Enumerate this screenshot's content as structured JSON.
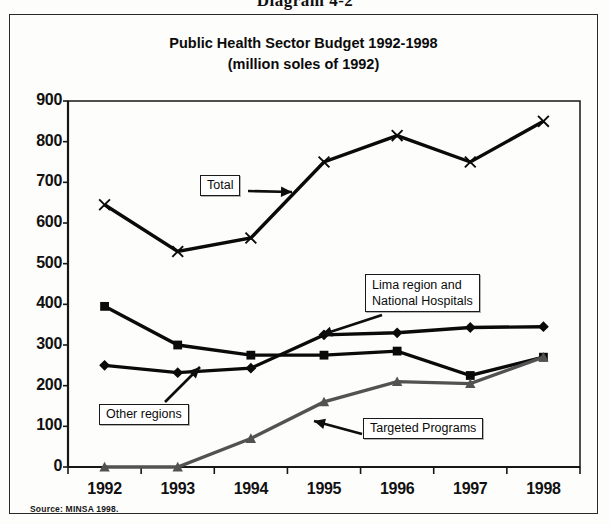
{
  "caption": "Diagram 4-2",
  "source_note": "Source: MINSA 1998.",
  "chart_data": {
    "type": "line",
    "title": "Public Health Sector Budget 1992-1998",
    "subtitle": "(million soles of 1992)",
    "title_line1": "Public Health Sector Budget 1992-1998",
    "title_line2": "(million soles of 1992)",
    "xlabel": "",
    "ylabel": "",
    "categories": [
      "1992",
      "1993",
      "1994",
      "1995",
      "1996",
      "1997",
      "1998"
    ],
    "x": [
      1992,
      1993,
      1994,
      1995,
      1996,
      1997,
      1998
    ],
    "ylim": [
      0,
      900
    ],
    "yticks": [
      0,
      100,
      200,
      300,
      400,
      500,
      600,
      700,
      800,
      900
    ],
    "ytick_labels": [
      "0",
      "100",
      "200",
      "300",
      "400",
      "500",
      "600",
      "700",
      "800",
      "900"
    ],
    "grid": false,
    "legend_position": "inline-callouts",
    "series": [
      {
        "name": "Total",
        "marker": "x",
        "color": "#111111",
        "values": [
          645,
          530,
          563,
          750,
          815,
          750,
          850
        ]
      },
      {
        "name": "Lima region and National Hospitals",
        "marker": "diamond",
        "color": "#111111",
        "values": [
          250,
          232,
          243,
          325,
          330,
          343,
          345
        ]
      },
      {
        "name": "Other regions",
        "marker": "square",
        "color": "#111111",
        "values": [
          395,
          300,
          275,
          275,
          285,
          225,
          270
        ]
      },
      {
        "name": "Targeted Programs",
        "marker": "triangle",
        "color": "#555555",
        "values": [
          0,
          0,
          70,
          160,
          210,
          205,
          270
        ]
      }
    ],
    "annotations": [
      {
        "id": "total",
        "text": "Total",
        "points_to": "Total series",
        "arrow": "right"
      },
      {
        "id": "lima",
        "text_line1": "Lima region and",
        "text_line2": "National Hospitals",
        "points_to": "Lima region and National Hospitals series",
        "arrow": "down-left"
      },
      {
        "id": "other",
        "text": "Other regions",
        "points_to": "Other regions series",
        "arrow": "up-right"
      },
      {
        "id": "targeted",
        "text": "Targeted Programs",
        "points_to": "Targeted Programs series",
        "arrow": "left"
      }
    ]
  }
}
